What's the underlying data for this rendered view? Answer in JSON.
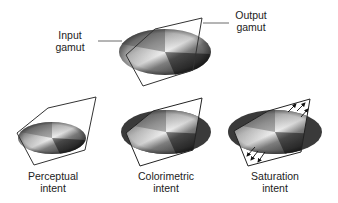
{
  "figure": {
    "top": {
      "input_label": [
        "Input",
        "gamut"
      ],
      "output_label": [
        "Output",
        "gamut"
      ]
    },
    "panels": [
      {
        "id": "perceptual",
        "label": [
          "Perceptual",
          "intent"
        ]
      },
      {
        "id": "colorimetric",
        "label": [
          "Colorimetric",
          "intent"
        ]
      },
      {
        "id": "saturation",
        "label": [
          "Saturation",
          "intent"
        ]
      }
    ]
  },
  "colors": {
    "outline": "#333333",
    "leader": "#444444",
    "text": "#222222",
    "gradient_light": "#f2f2f2",
    "gradient_dark": "#1a1a1a",
    "clipped_dark": "#3a3a3a"
  }
}
